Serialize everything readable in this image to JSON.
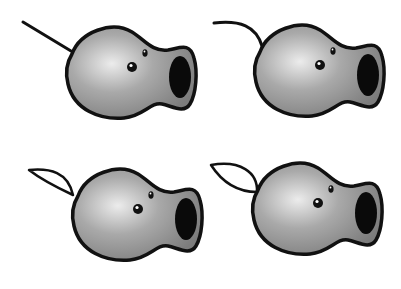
{
  "figure": {
    "colors": {
      "background": "#ffffff",
      "outline": "#111111",
      "body_light": "#e4e4e4",
      "body_mid": "#a8a8a8",
      "body_dark": "#7a7a7a",
      "mouth": "#0a0a0a",
      "eye": "#111111",
      "leaf_fill": "#ffffff"
    },
    "variants": [
      {
        "id": "top-left",
        "stem": "straight-line"
      },
      {
        "id": "top-right",
        "stem": "curved-line"
      },
      {
        "id": "bottom-left",
        "stem": "narrow-leaf"
      },
      {
        "id": "bottom-right",
        "stem": "wide-leaf"
      }
    ]
  }
}
